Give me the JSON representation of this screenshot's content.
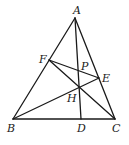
{
  "diagram": {
    "type": "geometry-triangle",
    "points": {
      "A": {
        "x": 75,
        "y": 18
      },
      "B": {
        "x": 13,
        "y": 119
      },
      "C": {
        "x": 115,
        "y": 119
      },
      "D": {
        "x": 81,
        "y": 119
      },
      "E": {
        "x": 99,
        "y": 78
      },
      "F": {
        "x": 49,
        "y": 60
      },
      "H": {
        "x": 79,
        "y": 87
      },
      "P": {
        "x": 78,
        "y": 70
      }
    },
    "labels": {
      "A": "A",
      "B": "B",
      "C": "C",
      "D": "D",
      "E": "E",
      "F": "F",
      "H": "H",
      "P": "P"
    },
    "segments": [
      [
        "A",
        "B"
      ],
      [
        "A",
        "C"
      ],
      [
        "B",
        "C"
      ],
      [
        "A",
        "D"
      ],
      [
        "B",
        "E"
      ],
      [
        "C",
        "F"
      ],
      [
        "F",
        "E"
      ]
    ],
    "colors": {
      "stroke": "#1a1a1a",
      "background": "#ffffff"
    }
  }
}
